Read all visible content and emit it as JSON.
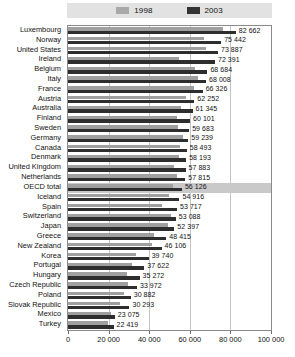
{
  "chart_data": {
    "type": "bar",
    "orientation": "horizontal",
    "title": "",
    "xlabel": "",
    "ylabel": "",
    "xlim": [
      0,
      100000
    ],
    "xticks": [
      0,
      20000,
      40000,
      60000,
      80000,
      100000
    ],
    "xtick_labels": [
      "0",
      "20 000",
      "40 000",
      "60 000",
      "80 000",
      "100 000"
    ],
    "grid": true,
    "legend_position": "top",
    "highlight_category": "OECD total",
    "categories": [
      "Luxembourg",
      "Norway",
      "United States",
      "Ireland",
      "Belgium",
      "Italy",
      "France",
      "Austria",
      "Australia",
      "Finland",
      "Sweden",
      "Germany",
      "Canada",
      "Denmark",
      "United Kingdom",
      "Netherlands",
      "OECD total",
      "Iceland",
      "Spain",
      "Switzerland",
      "Japan",
      "Greece",
      "New Zealand",
      "Korea",
      "Portugal",
      "Hungary",
      "Czech Republic",
      "Poland",
      "Slovak Republic",
      "Mexico",
      "Turkey"
    ],
    "series": [
      {
        "name": "1998",
        "color": "#a0a0a0",
        "values": [
          76500,
          66800,
          68200,
          54500,
          62800,
          64200,
          62000,
          58000,
          55800,
          53500,
          54200,
          56500,
          55000,
          54800,
          52000,
          53800,
          51500,
          49800,
          46500,
          50800,
          49500,
          42500,
          41200,
          33500,
          31500,
          29000,
          29500,
          27500,
          25500,
          21000,
          19500
        ]
      },
      {
        "name": "2003",
        "color": "#2e2e2e",
        "values": [
          82662,
          75442,
          73887,
          72391,
          68684,
          68008,
          66326,
          62252,
          61345,
          60101,
          59683,
          59239,
          58493,
          58193,
          57883,
          57815,
          56126,
          54916,
          53717,
          53088,
          52397,
          48415,
          46106,
          39740,
          37622,
          35272,
          33972,
          30882,
          30293,
          23075,
          22419
        ]
      }
    ],
    "value_labels": [
      "82 662",
      "75 442",
      "73 887",
      "72 391",
      "68 684",
      "68 008",
      "66 326",
      "62 252",
      "61 345",
      "60 101",
      "59 683",
      "59 239",
      "58 493",
      "58 193",
      "57 883",
      "57 815",
      "56 126",
      "54 916",
      "53 717",
      "53 088",
      "52 397",
      "48 415",
      "46 106",
      "39 740",
      "37 622",
      "35 272",
      "33 972",
      "30 882",
      "30 293",
      "23 075",
      "22 419"
    ]
  },
  "legend": {
    "entries": [
      {
        "label": "1998",
        "color": "#a0a0a0"
      },
      {
        "label": "2003",
        "color": "#2e2e2e"
      }
    ]
  }
}
